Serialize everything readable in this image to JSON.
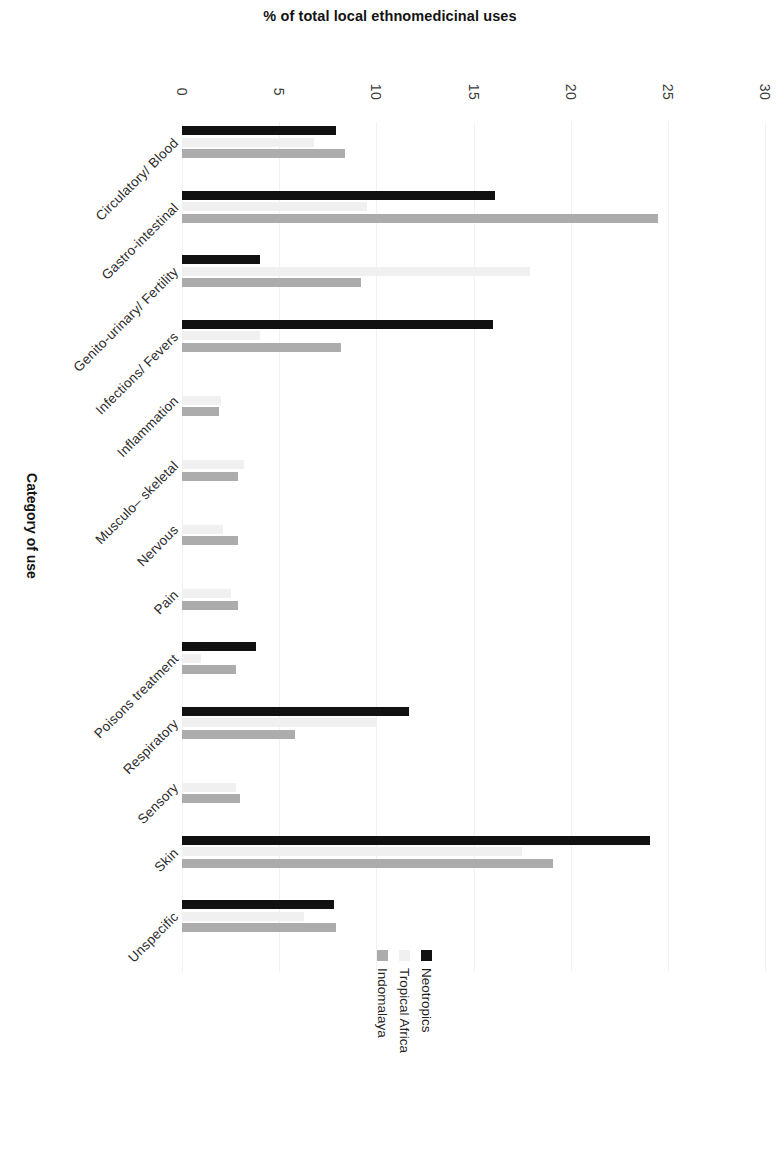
{
  "chart_data": {
    "type": "bar",
    "orientation": "horizontal",
    "title": "% of total local ethnomedicinal uses",
    "xlabel": "% of total local ethnomedicinal uses",
    "ylabel": "Category of use",
    "xlim": [
      0,
      30
    ],
    "xticks": [
      0,
      5,
      10,
      15,
      20,
      25,
      30
    ],
    "xtick_labels": [
      "0",
      "5",
      "10",
      "15",
      "20",
      "25",
      "30"
    ],
    "grid": false,
    "legend_position": "bottom-center",
    "categories": [
      "Circulatory/ Blood",
      "Gastro-intestinal",
      "Genito-urinary/ Fertility",
      "Infections/ Fevers",
      "Inflammation",
      "Musculo– skeletal",
      "Nervous",
      "Pain",
      "Poisons treatment",
      "Respiratory",
      "Sensory",
      "Skin",
      "Unspecific"
    ],
    "series": [
      {
        "name": "Neotropics",
        "color": "#111111",
        "values": [
          7.9,
          16.1,
          4.0,
          16.0,
          0,
          0,
          0,
          0,
          3.8,
          11.7,
          0,
          24.1,
          7.8
        ]
      },
      {
        "name": "Tropical Africa",
        "color": "#f0f0f0",
        "values": [
          6.8,
          9.5,
          17.9,
          4.0,
          2.0,
          3.2,
          2.1,
          2.5,
          1.0,
          10.0,
          2.8,
          17.5,
          6.3
        ]
      },
      {
        "name": "Indomalaya",
        "color": "#acacac",
        "values": [
          8.4,
          24.5,
          9.2,
          8.2,
          1.9,
          2.9,
          2.9,
          2.9,
          2.8,
          5.8,
          3.0,
          19.1,
          7.9
        ]
      }
    ]
  },
  "legend": {
    "items": [
      {
        "label": "Neotropics",
        "swatch": "black-square-icon"
      },
      {
        "label": "Tropical Africa",
        "swatch": "light-gray-square-icon"
      },
      {
        "label": "Indomalaya",
        "swatch": "medium-gray-square-icon"
      }
    ]
  },
  "axes": {
    "x_title": "% of total local ethnomedicinal uses",
    "y_title": "Category of use"
  }
}
